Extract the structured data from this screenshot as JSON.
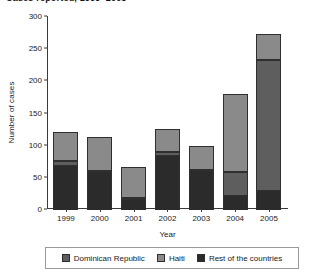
{
  "figure": {
    "title": "Cases reported, 1999–2005"
  },
  "chart_data": {
    "type": "bar",
    "stacked": true,
    "title": "Cases reported, 1999–2005",
    "xlabel": "Year",
    "ylabel": "Number of cases",
    "ylim": [
      0,
      300
    ],
    "yticks": [
      0,
      50,
      100,
      150,
      200,
      250,
      300
    ],
    "grid": false,
    "legend_position": "bottom",
    "categories": [
      "1999",
      "2000",
      "2001",
      "2002",
      "2003",
      "2004",
      "2005"
    ],
    "series": [
      {
        "name": "Rest of the countries",
        "color": "#2b2b2b",
        "values": [
          70,
          61,
          17,
          86,
          62,
          23,
          31
        ]
      },
      {
        "name": "Dominican Republic",
        "color": "#5e5e5e",
        "values": [
          8,
          1,
          4,
          6,
          1,
          37,
          204
        ]
      },
      {
        "name": "Haiti",
        "color": "#8a8a8a",
        "values": [
          45,
          52,
          48,
          35,
          38,
          122,
          40
        ]
      }
    ],
    "totals": [
      123,
      114,
      69,
      127,
      101,
      182,
      275
    ]
  },
  "legend": {
    "items": [
      {
        "label": "Dominican Republic",
        "color": "#5e5e5e"
      },
      {
        "label": "Haiti",
        "color": "#8a8a8a"
      },
      {
        "label": "Rest of the countries",
        "color": "#2b2b2b"
      }
    ]
  }
}
